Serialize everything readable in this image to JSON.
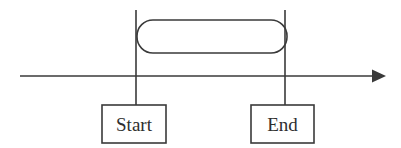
{
  "diagram": {
    "type": "timeline-interval",
    "background_color": "#ffffff",
    "stroke_color": "#3a3a3a",
    "text_color": "#2e2e2e",
    "timeline": {
      "name": "time-axis",
      "x_start": 20,
      "x_end": 385,
      "y": 76,
      "arrow_direction": "right",
      "label": ""
    },
    "markers": [
      {
        "id": "start",
        "label": "Start",
        "x": 136,
        "line_top": 10,
        "line_bottom": 105,
        "box": {
          "x": 102,
          "y": 105,
          "width": 64,
          "height": 38
        }
      },
      {
        "id": "end",
        "label": "End",
        "x": 285,
        "line_top": 10,
        "line_bottom": 105,
        "box": {
          "x": 251,
          "y": 105,
          "width": 63,
          "height": 38
        }
      }
    ],
    "interval_shape": {
      "name": "duration-stadium",
      "shape": "rounded-rectangle",
      "label": "",
      "x": 137,
      "y": 20,
      "width": 150,
      "height": 33,
      "corner_radius": 16
    }
  }
}
